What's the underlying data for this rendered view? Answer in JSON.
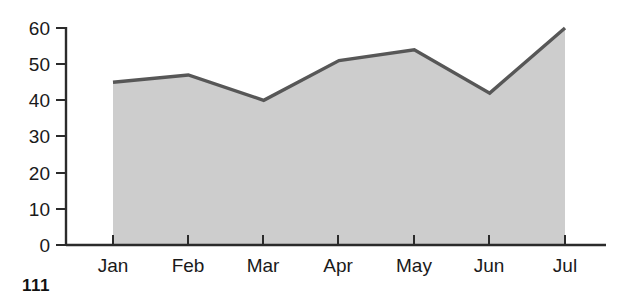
{
  "page": {
    "page_number": "111"
  },
  "chart_data": {
    "type": "area",
    "title": "",
    "subtitle": "",
    "xlabel": "",
    "ylabel": "",
    "categories": [
      "Jan",
      "Feb",
      "Mar",
      "Apr",
      "May",
      "Jun",
      "Jul"
    ],
    "values": [
      45,
      47,
      40,
      51,
      54,
      42,
      60
    ],
    "series": [
      {
        "name": "",
        "values": [
          45,
          47,
          40,
          51,
          54,
          42,
          60
        ]
      }
    ],
    "ylim": [
      0,
      60
    ],
    "yticks": [
      0,
      10,
      20,
      30,
      40,
      50,
      60
    ],
    "ytick_labels": [
      "0",
      "10",
      "20",
      "30",
      "40",
      "50",
      "60"
    ],
    "xtick_labels": [
      "Jan",
      "Feb",
      "Mar",
      "Apr",
      "May",
      "Jun",
      "Jul"
    ],
    "grid": false,
    "legend": null,
    "legend_position": "none",
    "colors": {
      "area_fill": "#cdcdcd",
      "line": "#575757",
      "axis": "#2b2b2b",
      "text": "#1a1a1a",
      "background": "#ffffff"
    },
    "annotations": []
  }
}
